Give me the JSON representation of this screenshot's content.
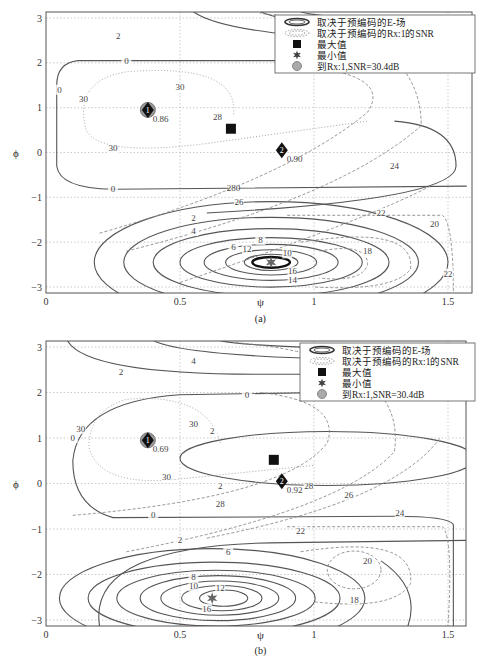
{
  "chart_data": [
    {
      "type": "contour",
      "panel_label": "(a)",
      "xlabel": "ψ",
      "ylabel": "ϕ",
      "xlim": [
        0,
        1.57
      ],
      "ylim": [
        -3.14,
        3.14
      ],
      "xticks": [
        "0",
        "0.5",
        "1",
        "1.5"
      ],
      "yticks": [
        "3",
        "2",
        "1",
        "0",
        "-1",
        "-2",
        "-3"
      ],
      "grid": true,
      "legend_position": "top-right",
      "legend": [
        {
          "symbol": "solid-ellipse",
          "label": "取决于预编码的E-场"
        },
        {
          "symbol": "dashed-ellipse",
          "label": "取决于预编码的Rx:1的SNR"
        },
        {
          "symbol": "filled-square",
          "label": "最大值"
        },
        {
          "symbol": "star",
          "label": "最小值"
        },
        {
          "symbol": "gray-circle",
          "label": "到Rx:1,SNR=30.4dB"
        }
      ],
      "efield_contour_levels": [
        0,
        2,
        4,
        6,
        8,
        10,
        12,
        14,
        16,
        18
      ],
      "snr_contour_levels": [
        18,
        20,
        22,
        24,
        26,
        28,
        30
      ],
      "markers": [
        {
          "type": "diamond",
          "label": "1",
          "x": 0.38,
          "y": 0.95,
          "value": "0.86",
          "with_circle": true
        },
        {
          "type": "diamond",
          "label": "2",
          "x": 0.88,
          "y": 0.05,
          "value": "0.90"
        },
        {
          "type": "square",
          "x": 0.69,
          "y": 0.53
        },
        {
          "type": "star",
          "x": 0.84,
          "y": -2.45
        }
      ]
    },
    {
      "type": "contour",
      "panel_label": "(b)",
      "xlabel": "ψ",
      "ylabel": "ϕ",
      "xlim": [
        0,
        1.57
      ],
      "ylim": [
        -3.14,
        3.14
      ],
      "xticks": [
        "0",
        "0.5",
        "1",
        "1.5"
      ],
      "yticks": [
        "3",
        "2",
        "1",
        "0",
        "-1",
        "-2",
        "-3"
      ],
      "grid": true,
      "legend_position": "top-right",
      "legend": [
        {
          "symbol": "solid-ellipse",
          "label": "取决于预编码的E-场"
        },
        {
          "symbol": "dashed-ellipse",
          "label": "取决于预编码的Rx:1的SNR"
        },
        {
          "symbol": "filled-square",
          "label": "最大值"
        },
        {
          "symbol": "star",
          "label": "最小值"
        },
        {
          "symbol": "gray-circle",
          "label": "到Rx:1,SNR=30.4dB"
        }
      ],
      "efield_contour_levels": [
        0,
        2,
        4,
        6,
        8,
        10,
        12,
        14,
        16
      ],
      "snr_contour_levels": [
        18,
        20,
        22,
        24,
        26,
        28,
        30
      ],
      "markers": [
        {
          "type": "diamond",
          "label": "1",
          "x": 0.38,
          "y": 0.95,
          "value": "0.69",
          "with_circle": true
        },
        {
          "type": "diamond",
          "label": "2",
          "x": 0.88,
          "y": 0.05,
          "value": "0.92"
        },
        {
          "type": "square",
          "x": 0.85,
          "y": 0.52
        },
        {
          "type": "star",
          "x": 0.62,
          "y": -2.52
        }
      ]
    }
  ]
}
